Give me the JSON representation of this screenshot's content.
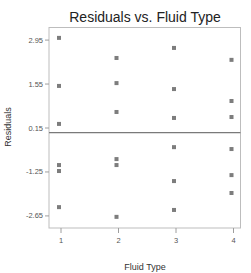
{
  "chart_data": {
    "type": "scatter",
    "title": "Residuals vs. Fluid Type",
    "xlabel": "Fluid Type",
    "ylabel": "Residuals",
    "x_ticks": [
      "1",
      "2",
      "3",
      "4"
    ],
    "y_ticks": [
      "2.95",
      "1.55",
      "0.15",
      "-1.25",
      "-2.65"
    ],
    "y_tick_values": [
      2.95,
      1.55,
      0.15,
      -1.25,
      -2.65
    ],
    "ylim": [
      -3.0,
      3.4
    ],
    "xlim": [
      0.9,
      4.1
    ],
    "reference_line": 0,
    "grid": false,
    "legend": null,
    "marker_color": "#7d7d7d",
    "series": [
      {
        "name": "Residuals",
        "points": [
          {
            "x": 1,
            "y": 3.02
          },
          {
            "x": 1,
            "y": 1.49
          },
          {
            "x": 1,
            "y": 0.28
          },
          {
            "x": 1,
            "y": -1.03
          },
          {
            "x": 1,
            "y": -1.22
          },
          {
            "x": 1,
            "y": -2.37
          },
          {
            "x": 2,
            "y": 2.38
          },
          {
            "x": 2,
            "y": 1.58
          },
          {
            "x": 2,
            "y": 0.66
          },
          {
            "x": 2,
            "y": -0.84
          },
          {
            "x": 2,
            "y": -1.03
          },
          {
            "x": 2,
            "y": -2.68
          },
          {
            "x": 3,
            "y": 2.7
          },
          {
            "x": 3,
            "y": 1.39
          },
          {
            "x": 3,
            "y": 0.47
          },
          {
            "x": 3,
            "y": -0.46
          },
          {
            "x": 3,
            "y": -1.54
          },
          {
            "x": 3,
            "y": -2.46
          },
          {
            "x": 4,
            "y": 2.32
          },
          {
            "x": 4,
            "y": 1.01
          },
          {
            "x": 4,
            "y": 0.5
          },
          {
            "x": 4,
            "y": -0.52
          },
          {
            "x": 4,
            "y": -1.35
          },
          {
            "x": 4,
            "y": -1.92
          }
        ]
      }
    ]
  }
}
